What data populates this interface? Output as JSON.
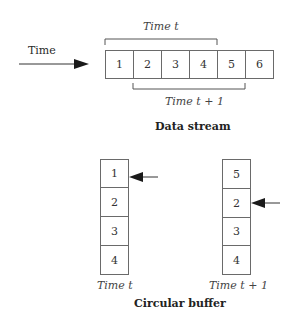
{
  "data_stream": {
    "time_label": "Time",
    "cells": [
      "1",
      "2",
      "3",
      "4",
      "5",
      "6"
    ],
    "bracket_top_label": "Time t",
    "bracket_bottom_label": "Time t + 1",
    "caption": "Data stream"
  },
  "circular_buffer": {
    "left": {
      "cells": [
        "1",
        "2",
        "3",
        "4"
      ],
      "pointer_index": 0,
      "label": "Time t"
    },
    "right": {
      "cells": [
        "5",
        "2",
        "3",
        "4"
      ],
      "pointer_index": 1,
      "label": "Time t + 1"
    },
    "caption": "Circular buffer"
  },
  "colors": {
    "stroke": "#6a6a6a",
    "arrow": "#222222",
    "text": "#2a2a2a"
  }
}
